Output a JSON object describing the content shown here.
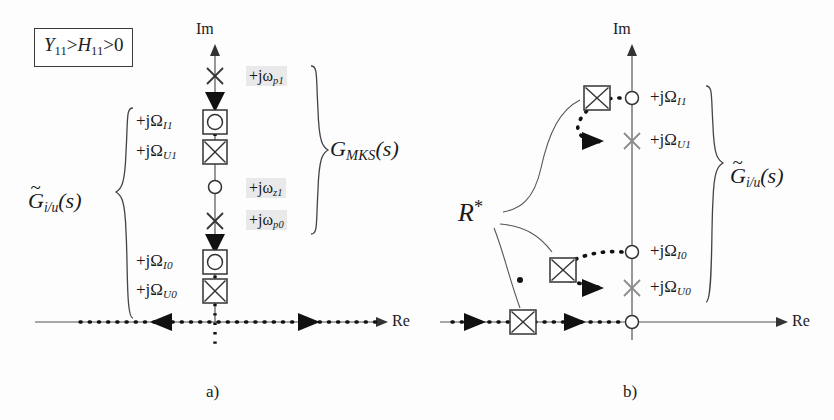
{
  "figure": {
    "title_caption_a": "a)",
    "title_caption_b": "b)",
    "axis_im": "Im",
    "axis_re": "Re"
  },
  "panel_a": {
    "condition_box": {
      "lhs": "Y",
      "lhs_sub": "11",
      "rel1": ">",
      "mid": "H",
      "mid_sub": "11",
      "rel2": ">",
      "rhs": "0",
      "full_text": "Y11>H11>0"
    },
    "brace_left_label": {
      "base": "G",
      "tilde": "~",
      "sub": "i/u",
      "arg": "(s)",
      "full_text": "G̃i/u(s)"
    },
    "brace_right_label": {
      "base": "G",
      "sub": "MKS",
      "arg": "(s)",
      "full_text": "GMKS(s)"
    },
    "left_labels": [
      {
        "text": "+jΩ",
        "sub": "I1",
        "y": 122
      },
      {
        "text": "+jΩ",
        "sub": "U1",
        "y": 152
      },
      {
        "text": "+jΩ",
        "sub": "I0",
        "y": 262
      },
      {
        "text": "+jΩ",
        "sub": "U0",
        "y": 291
      }
    ],
    "right_labels": [
      {
        "text": "+jω",
        "sub": "p1",
        "y": 78,
        "highlight": true
      },
      {
        "text": "+jω",
        "sub": "z1",
        "y": 190,
        "highlight": true
      },
      {
        "text": "+jω",
        "sub": "p0",
        "y": 222,
        "highlight": true
      }
    ],
    "markers": [
      {
        "kind": "cross",
        "label": "pole +jωp1",
        "y": 76
      },
      {
        "kind": "triangle-down",
        "label": "locus-arrow-down-upper",
        "y": 100
      },
      {
        "kind": "boxed-circle",
        "label": "+jΩI1",
        "y": 122
      },
      {
        "kind": "boxed-cross",
        "label": "+jΩU1",
        "y": 152
      },
      {
        "kind": "circle",
        "label": "zero +jωz1",
        "y": 187
      },
      {
        "kind": "cross",
        "label": "pole +jωp0",
        "y": 221
      },
      {
        "kind": "triangle-down",
        "label": "locus-arrow-down-lower",
        "y": 242
      },
      {
        "kind": "boxed-circle",
        "label": "+jΩI0",
        "y": 262
      },
      {
        "kind": "boxed-cross",
        "label": "+jΩU0",
        "y": 291
      }
    ],
    "real_axis_arrows": [
      {
        "dir": "left",
        "x": 160
      },
      {
        "dir": "right",
        "x": 305
      }
    ],
    "origin_x": 215,
    "real_axis_y": 322
  },
  "panel_b": {
    "brace_right_label": {
      "base": "G",
      "tilde": "~",
      "sub": "i/u",
      "arg": "(s)",
      "full_text": "G̃i/u(s)"
    },
    "r_star_label": {
      "base": "R",
      "sup": "*",
      "full_text": "R*"
    },
    "right_labels": [
      {
        "text": "+jΩ",
        "sub": "I1",
        "y": 98
      },
      {
        "text": "+jΩ",
        "sub": "U1",
        "y": 141
      },
      {
        "text": "+jΩ",
        "sub": "I0",
        "y": 252
      },
      {
        "text": "+jΩ",
        "sub": "U0",
        "y": 288
      }
    ],
    "markers": [
      {
        "kind": "circle",
        "label": "+jΩI1",
        "x": 632,
        "y": 98
      },
      {
        "kind": "cross",
        "label": "+jΩU1",
        "x": 632,
        "y": 141
      },
      {
        "kind": "boxed-cross",
        "label": "closed-loop-root-upper",
        "x": 597,
        "y": 98
      },
      {
        "kind": "circle",
        "label": "+jΩI0",
        "x": 632,
        "y": 252
      },
      {
        "kind": "cross",
        "label": "+jΩU0",
        "x": 632,
        "y": 288
      },
      {
        "kind": "boxed-cross",
        "label": "closed-loop-root-mid",
        "x": 563,
        "y": 270
      },
      {
        "kind": "boxed-cross",
        "label": "closed-loop-root-real",
        "x": 523,
        "y": 322
      },
      {
        "kind": "circle",
        "label": "origin-zero",
        "x": 632,
        "y": 322
      }
    ],
    "real_axis_arrows": [
      {
        "dir": "right",
        "x": 474
      },
      {
        "dir": "right",
        "x": 574
      }
    ],
    "origin_x": 632,
    "real_axis_y": 322
  },
  "colors": {
    "ink": "#1a1a1a",
    "axis": "#555555",
    "marker_gray": "#8a8a8a",
    "highlight_bg": "#e9e9e9",
    "page_bg": "#fdfdfd"
  }
}
